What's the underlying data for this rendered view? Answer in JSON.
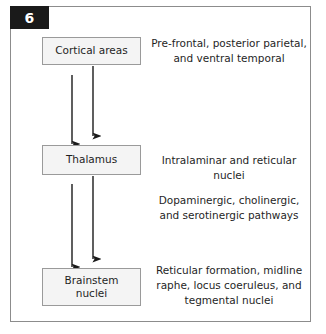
{
  "figure": {
    "number": "6",
    "nodes": [
      {
        "id": "cortical",
        "label": "Cortical areas"
      },
      {
        "id": "thalamus",
        "label": "Thalamus"
      },
      {
        "id": "brainstem",
        "label": "Brainstem\nnuclei"
      }
    ],
    "notes": [
      {
        "id": "cortical",
        "text": "Pre-frontal, posterior parietal, and ventral temporal"
      },
      {
        "id": "thalamus",
        "text": "Intralaminar and reticular nuclei"
      },
      {
        "id": "pathways",
        "text": "Dopaminergic, cholinergic, and serotinergic pathways"
      },
      {
        "id": "brainstem",
        "text": "Reticular formation, midline raphe, locus coeruleus, and tegmental nuclei"
      }
    ],
    "connectors": [
      {
        "id": "thalamus-to-cortical",
        "direction": "up",
        "from": "thalamus",
        "to": "cortical"
      },
      {
        "id": "cortical-to-thalamus",
        "direction": "down",
        "from": "cortical",
        "to": "thalamus"
      },
      {
        "id": "brainstem-to-thalamus",
        "direction": "up",
        "from": "brainstem",
        "to": "thalamus"
      },
      {
        "id": "thalamus-to-brainstem",
        "direction": "down",
        "from": "thalamus",
        "to": "brainstem"
      }
    ],
    "colors": {
      "badge_background": "#1a1a1a",
      "badge_text": "#ffffff",
      "node_fill": "#f4f4f4",
      "node_border": "#9a9a9a",
      "frame_border": "#8c8c8c",
      "arrow": "#1a1a1a",
      "text": "#1f1f1f"
    }
  }
}
